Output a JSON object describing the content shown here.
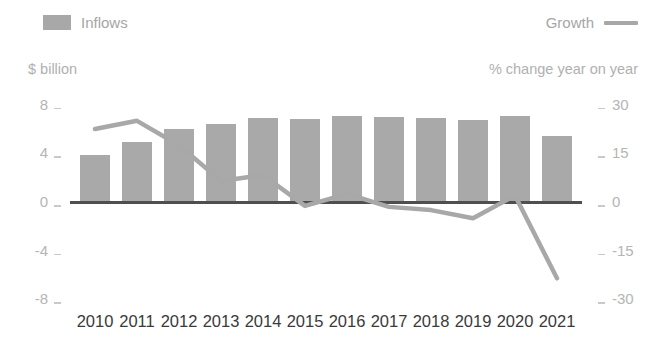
{
  "legend": {
    "inflows_label": "Inflows",
    "growth_label": "Growth",
    "swatch_color": "#a8a8a8",
    "line_color": "#a8a8a8"
  },
  "axes": {
    "left_caption": "$ billion",
    "right_caption": "% change year on year",
    "left_ticks": [
      "8",
      "4",
      "0",
      "-4",
      "-8"
    ],
    "right_ticks": [
      "30",
      "15",
      "0",
      "-15",
      "-30"
    ]
  },
  "colors": {
    "bar": "#a9a9a9",
    "line": "#a8a8a8",
    "zero_line": "#4f4f4f",
    "tick_text": "#b5b5b5",
    "category_text": "#3a3a3a",
    "caption_text": "#b0b0b0"
  },
  "chart_data": {
    "type": "bar",
    "title": "",
    "xlabel": "",
    "ylabel": "$ billion",
    "y2label": "% change year on year",
    "categories": [
      "2010",
      "2011",
      "2012",
      "2013",
      "2014",
      "2015",
      "2016",
      "2017",
      "2018",
      "2019",
      "2020",
      "2021"
    ],
    "ylim": [
      -8,
      8
    ],
    "y2lim": [
      -30,
      30
    ],
    "grid": false,
    "legend_position": "top",
    "series": [
      {
        "name": "Inflows",
        "type": "bar",
        "axis": "left",
        "unit": "$ billion",
        "values": [
          3.9,
          4.9,
          6.0,
          6.4,
          6.9,
          6.8,
          7.1,
          7.0,
          6.9,
          6.7,
          7.1,
          5.4
        ]
      },
      {
        "name": "Growth",
        "type": "line",
        "axis": "right",
        "unit": "% change year on year",
        "values": [
          22.5,
          25.0,
          17.5,
          6.5,
          8.3,
          -1.2,
          2.5,
          -1.5,
          -2.5,
          -5.0,
          2.0,
          -23.5
        ]
      }
    ]
  }
}
